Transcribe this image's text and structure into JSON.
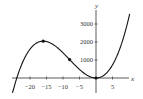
{
  "chart_data": {
    "type": "line",
    "title": "",
    "xlabel": "x",
    "ylabel": "y",
    "function": "y = x^3 + 24x^2",
    "xlim": [
      -25,
      10
    ],
    "ylim": [
      -400,
      3700
    ],
    "x_ticks": [
      -20,
      -15,
      -10,
      -5,
      5
    ],
    "x_tick_labels": [
      "−20",
      "−15",
      "−10",
      "−5",
      "5"
    ],
    "y_ticks": [
      1000,
      2000,
      3000
    ],
    "y_tick_labels": [
      "1000",
      "2000",
      "3000"
    ],
    "grid": false,
    "legend": null,
    "series": [
      {
        "name": "curve",
        "x": [
          -25,
          -24,
          -22,
          -20,
          -18,
          -16,
          -14,
          -12,
          -10,
          -8,
          -6,
          -4,
          -2,
          0,
          2,
          4,
          6,
          8,
          10
        ],
        "values": [
          -625,
          0,
          968,
          1600,
          1944,
          2048,
          1960,
          1728,
          1400,
          1024,
          648,
          320,
          88,
          0,
          104,
          448,
          1080,
          2048,
          3400
        ]
      }
    ],
    "marked_points": [
      {
        "x": -16,
        "y": 2048,
        "label": "local maximum"
      },
      {
        "x": -8,
        "y": 1024,
        "label": "inflection point"
      },
      {
        "x": 0,
        "y": 0,
        "label": "local minimum"
      }
    ],
    "colors": {
      "curve": "#111111",
      "axes": "#333333"
    }
  }
}
